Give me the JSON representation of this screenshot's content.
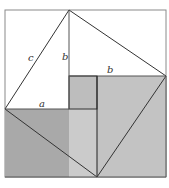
{
  "figure": {
    "labels": {
      "c": "c",
      "b_vertical": "b",
      "b_horizontal": "b",
      "a": "a"
    },
    "colors": {
      "background": "#ffffff",
      "outer_border": "#888888",
      "line": "#222222",
      "thin_line": "#777777",
      "square_a_fill": "#a9a9a9",
      "square_b_fill": "#c3c3c3",
      "overlap_fill": "#cbcbcb",
      "small_square_fill": "#bdbdbd"
    }
  }
}
